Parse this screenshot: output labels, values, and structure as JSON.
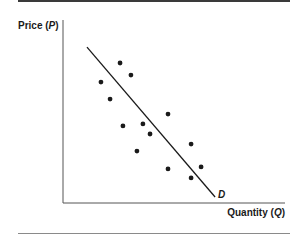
{
  "chart_data": {
    "type": "scatter",
    "title": "",
    "xlabel": "Quantity (Q)",
    "ylabel": "Price (P)",
    "xlabel_parts": {
      "prefix": "Quantity (",
      "var": "Q",
      "suffix": ")"
    },
    "ylabel_parts": {
      "prefix": "Price (",
      "var": "P",
      "suffix": ")"
    },
    "xlim": [
      0,
      100
    ],
    "ylim": [
      0,
      100
    ],
    "grid": false,
    "ticks": false,
    "legend": null,
    "series": [
      {
        "name": "observations",
        "type": "scatter",
        "points": [
          {
            "x": 25.7,
            "y": 76.5
          },
          {
            "x": 30.6,
            "y": 69.9
          },
          {
            "x": 17.1,
            "y": 66.1
          },
          {
            "x": 21.2,
            "y": 56.8
          },
          {
            "x": 27.0,
            "y": 42.1
          },
          {
            "x": 36.0,
            "y": 43.2
          },
          {
            "x": 39.2,
            "y": 37.7
          },
          {
            "x": 47.3,
            "y": 48.6
          },
          {
            "x": 33.3,
            "y": 28.4
          },
          {
            "x": 57.7,
            "y": 32.2
          },
          {
            "x": 47.3,
            "y": 18.6
          },
          {
            "x": 62.2,
            "y": 19.7
          },
          {
            "x": 57.7,
            "y": 13.7
          }
        ]
      },
      {
        "name": "D",
        "type": "line",
        "points": [
          {
            "x": 10.8,
            "y": 85.2
          },
          {
            "x": 68.5,
            "y": 3.3
          }
        ]
      }
    ],
    "annotations": [
      {
        "text": "D",
        "near": "end of demand line"
      }
    ],
    "colors": {
      "points": "#1a1a1a",
      "line": "#1a1a1a",
      "axes": "#555555"
    }
  }
}
